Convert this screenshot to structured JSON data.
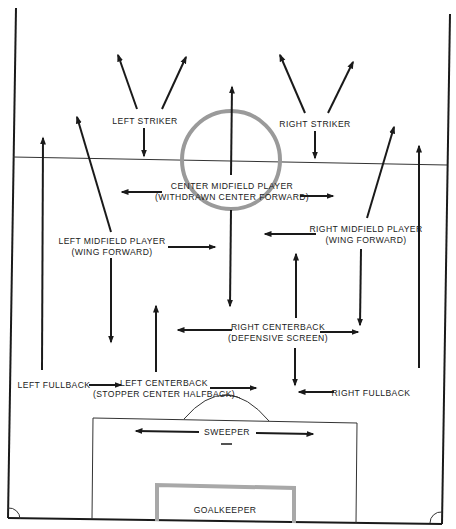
{
  "diagram": {
    "type": "soccer-formation",
    "colors": {
      "lines": "#1a1a1a",
      "center_circle": "#9a9a9a",
      "goal_box": "#a8a8a8",
      "background": "#ffffff"
    },
    "positions": {
      "left_striker": {
        "line1": "LEFT STRIKER"
      },
      "right_striker": {
        "line1": "RIGHT STRIKER"
      },
      "center_midfield": {
        "line1": "CENTER MIDFIELD PLAYER",
        "line2": "(WITHDRAWN CENTER FORWARD)"
      },
      "left_midfield": {
        "line1": "LEFT MIDFIELD PLAYER",
        "line2": "(WING FORWARD)"
      },
      "right_midfield": {
        "line1": "RIGHT MIDFIELD PLAYER",
        "line2": "(WING FORWARD)"
      },
      "right_centerback": {
        "line1": "RIGHT CENTERBACK",
        "line2": "(DEFENSIVE SCREEN)"
      },
      "left_fullback": {
        "line1": "LEFT FULLBACK"
      },
      "left_centerback": {
        "line1": "LEFT CENTERBACK",
        "line2": "(STOPPER CENTER HALFBACK)"
      },
      "right_fullback": {
        "line1": "RIGHT FULLBACK"
      },
      "sweeper": {
        "line1": "SWEEPER"
      },
      "goalkeeper": {
        "line1": "GOALKEEPER"
      }
    }
  }
}
